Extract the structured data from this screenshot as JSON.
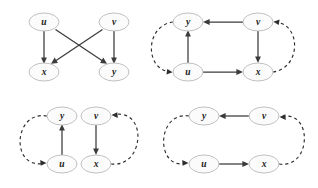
{
  "figure": {
    "width": 318,
    "height": 188,
    "background": "#ffffff",
    "node_fill": "#fbfbfb",
    "node_stroke": "#b9b9b9",
    "solid_edge_color": "#3b3b3b",
    "dashed_edge_color": "#2e2e2e",
    "label_color": "#1a1a1a"
  },
  "panels": [
    {
      "id": "panel-top-left",
      "nodes": [
        {
          "id": "u",
          "label": "u",
          "cx": 44,
          "cy": 22
        },
        {
          "id": "v",
          "label": "v",
          "cx": 114,
          "cy": 22
        },
        {
          "id": "x",
          "label": "x",
          "cx": 44,
          "cy": 72
        },
        {
          "id": "y",
          "label": "y",
          "cx": 114,
          "cy": 72
        }
      ],
      "edges": [
        {
          "from": "u",
          "to": "x",
          "style": "solid",
          "arrow": "to"
        },
        {
          "from": "u",
          "to": "y",
          "style": "solid",
          "arrow": "to"
        },
        {
          "from": "v",
          "to": "x",
          "style": "solid",
          "arrow": "to"
        },
        {
          "from": "v",
          "to": "y",
          "style": "solid",
          "arrow": "to"
        }
      ]
    },
    {
      "id": "panel-top-right",
      "nodes": [
        {
          "id": "y",
          "label": "y",
          "cx": 29,
          "cy": 22
        },
        {
          "id": "v",
          "label": "v",
          "cx": 99,
          "cy": 22
        },
        {
          "id": "u",
          "label": "u",
          "cx": 29,
          "cy": 72
        },
        {
          "id": "x",
          "label": "x",
          "cx": 99,
          "cy": 72
        }
      ],
      "edges": [
        {
          "from": "u",
          "to": "y",
          "style": "solid",
          "arrow": "to"
        },
        {
          "from": "v",
          "to": "y",
          "style": "solid",
          "arrow": "to"
        },
        {
          "from": "v",
          "to": "x",
          "style": "solid",
          "arrow": "to"
        },
        {
          "from": "u",
          "to": "x",
          "style": "solid",
          "arrow": "to"
        },
        {
          "from": "x",
          "to": "v",
          "style": "dashed",
          "arrow": "to"
        },
        {
          "from": "y",
          "to": "u",
          "style": "dashed",
          "arrow": "to"
        }
      ]
    },
    {
      "id": "panel-bottom-left",
      "nodes": [
        {
          "id": "y",
          "label": "y",
          "cx": 62,
          "cy": 22
        },
        {
          "id": "v",
          "label": "v",
          "cx": 96,
          "cy": 22
        },
        {
          "id": "u",
          "label": "u",
          "cx": 62,
          "cy": 70
        },
        {
          "id": "x",
          "label": "x",
          "cx": 96,
          "cy": 70
        }
      ],
      "edges": [
        {
          "from": "u",
          "to": "y",
          "style": "solid",
          "arrow": "to"
        },
        {
          "from": "v",
          "to": "x",
          "style": "solid",
          "arrow": "to"
        },
        {
          "from": "y",
          "to": "u",
          "style": "dashed",
          "arrow": "to"
        },
        {
          "from": "x",
          "to": "v",
          "style": "dashed",
          "arrow": "to"
        }
      ]
    },
    {
      "id": "panel-bottom-right",
      "nodes": [
        {
          "id": "y",
          "label": "y",
          "cx": 45,
          "cy": 22
        },
        {
          "id": "v",
          "label": "v",
          "cx": 105,
          "cy": 22
        },
        {
          "id": "u",
          "label": "u",
          "cx": 45,
          "cy": 70
        },
        {
          "id": "x",
          "label": "x",
          "cx": 105,
          "cy": 70
        }
      ],
      "edges": [
        {
          "from": "v",
          "to": "y",
          "style": "solid",
          "arrow": "to"
        },
        {
          "from": "u",
          "to": "x",
          "style": "solid",
          "arrow": "to"
        },
        {
          "from": "y",
          "to": "u",
          "style": "dashed",
          "arrow": "to"
        },
        {
          "from": "x",
          "to": "v",
          "style": "dashed",
          "arrow": "to"
        }
      ]
    }
  ]
}
